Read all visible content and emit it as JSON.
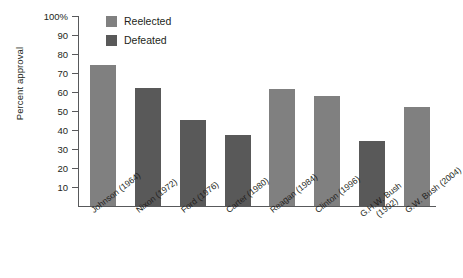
{
  "chart_data": {
    "type": "bar",
    "title": "",
    "xlabel": "",
    "ylabel": "Percent approval",
    "ylim": [
      0,
      100
    ],
    "yticks": [
      10,
      20,
      30,
      40,
      50,
      60,
      70,
      80,
      90,
      100
    ],
    "ytick_labels": [
      "10",
      "20",
      "30",
      "40",
      "50",
      "60",
      "70",
      "80",
      "90",
      "100%"
    ],
    "grid": false,
    "legend_position": "top-left-inside",
    "categories": [
      "Johnson (1964)",
      "Nixon (1972)",
      "Ford (1976)",
      "Carter (1980)",
      "Reagan (1984)",
      "Clinton (1996)",
      "G.H.W. Bush (1992)",
      "G.W. Bush (2004)"
    ],
    "values": [
      74,
      62,
      45,
      37.5,
      61.5,
      57.5,
      34,
      52
    ],
    "point_groups": [
      "Reelected",
      "Defeated",
      "Defeated",
      "Defeated",
      "Reelected",
      "Reelected",
      "Defeated",
      "Reelected"
    ],
    "series": [
      {
        "name": "Reelected",
        "color": "#808080",
        "points": [
          {
            "category": "Johnson (1964)",
            "value": 74
          },
          {
            "category": "Nixon (1972)",
            "value": 62
          },
          {
            "category": "Reagan (1984)",
            "value": 61.5
          },
          {
            "category": "Clinton (1996)",
            "value": 57.5
          },
          {
            "category": "G.W. Bush (2004)",
            "value": 52
          }
        ]
      },
      {
        "name": "Defeated",
        "color": "#595959",
        "points": [
          {
            "category": "Ford (1976)",
            "value": 45
          },
          {
            "category": "Carter (1980)",
            "value": 37.5
          },
          {
            "category": "G.H.W. Bush (1992)",
            "value": 34
          }
        ]
      }
    ]
  },
  "legend": {
    "items": [
      {
        "label": "Reelected",
        "color": "#808080"
      },
      {
        "label": "Defeated",
        "color": "#595959"
      }
    ]
  },
  "xlabels": [
    {
      "line1": "Johnson (1964)",
      "line2": ""
    },
    {
      "line1": "Nixon (1972)",
      "line2": ""
    },
    {
      "line1": "Ford (1976)",
      "line2": ""
    },
    {
      "line1": "Carter (1980)",
      "line2": ""
    },
    {
      "line1": "Reagan (1984)",
      "line2": ""
    },
    {
      "line1": "Clinton (1996)",
      "line2": ""
    },
    {
      "line1": "G.H.W. Bush",
      "line2": "(1992)"
    },
    {
      "line1": "G.W. Bush (2004)",
      "line2": ""
    }
  ],
  "axis": {
    "y_title": "Percent approval"
  }
}
